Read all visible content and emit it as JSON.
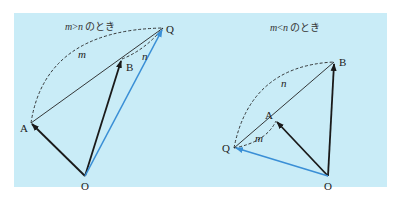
{
  "colors": {
    "background": "#ffffff",
    "panel": "#c9ecf7",
    "vector_black": "#1a1a1a",
    "vector_blue": "#3a8fd6",
    "line": "#222222"
  },
  "diagrams": [
    {
      "id": "left",
      "title": "m>n のとき",
      "title_var1": "m",
      "title_op": ">",
      "title_var2": "n",
      "title_suffix": "のとき",
      "points": {
        "O": {
          "label": "O",
          "x": 85,
          "y": 176
        },
        "A": {
          "label": "A",
          "x": 31,
          "y": 123
        },
        "B": {
          "label": "B",
          "x": 122,
          "y": 59
        },
        "Q": {
          "label": "Q",
          "x": 163,
          "y": 28
        }
      },
      "ratio_labels": {
        "m": "m",
        "n": "n"
      }
    },
    {
      "id": "right",
      "title": "m<n のとき",
      "title_var1": "m",
      "title_op": "<",
      "title_var2": "n",
      "title_suffix": "のとき",
      "points": {
        "O": {
          "label": "O",
          "x": 328,
          "y": 176
        },
        "A": {
          "label": "A",
          "x": 276,
          "y": 121
        },
        "B": {
          "label": "B",
          "x": 334,
          "y": 62
        },
        "Q": {
          "label": "Q",
          "x": 234,
          "y": 148
        }
      },
      "ratio_labels": {
        "m": "m",
        "n": "n"
      }
    }
  ]
}
